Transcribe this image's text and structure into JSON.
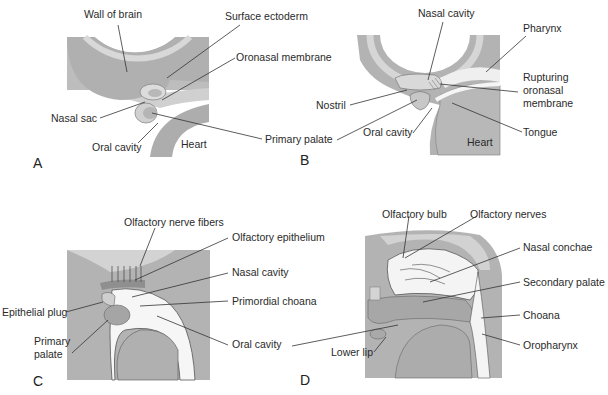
{
  "diagram": {
    "title": "",
    "colors": {
      "dark_tissue": "#a9a9a9",
      "mid_tissue": "#c4c4c4",
      "light_tissue": "#dcdcdc",
      "cavity": "#f7f7f7",
      "outline": "#555555",
      "leader_line": "#333333"
    },
    "panels": [
      {
        "id": "A",
        "letter": "A",
        "labels": [
          "Wall of brain",
          "Surface ectoderm",
          "Oronasal membrane",
          "Nasal sac",
          "Oral cavity",
          "Heart",
          "Primary palate"
        ]
      },
      {
        "id": "B",
        "letter": "B",
        "labels": [
          "Nasal cavity",
          "Pharynx",
          "Rupturing\noronasal\nmembrane",
          "Nostril",
          "Oral cavity",
          "Tongue",
          "Heart",
          "Primary palate"
        ]
      },
      {
        "id": "C",
        "letter": "C",
        "labels": [
          "Olfactory nerve fibers",
          "Olfactory epithelium",
          "Nasal cavity",
          "Primordial choana",
          "Epithelial plug",
          "Primary\npalate",
          "Oral cavity"
        ]
      },
      {
        "id": "D",
        "letter": "D",
        "labels": [
          "Olfactory bulb",
          "Olfactory nerves",
          "Nasal conchae",
          "Secondary palate",
          "Choana",
          "Oropharynx",
          "Lower lip"
        ]
      }
    ]
  }
}
